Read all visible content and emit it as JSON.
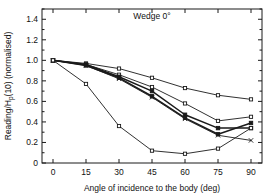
{
  "chart_data": {
    "type": "line",
    "title": "Wedge 0°",
    "xlabel": "Angle of incidence to the body (deg)",
    "ylabel": "Reading/Hₕ(10) (normalised)",
    "ylabel_parts": {
      "pre": "Reading/H",
      "sub": "p",
      "post": "(10) (normalised)"
    },
    "x": [
      0,
      15,
      30,
      45,
      60,
      75,
      90
    ],
    "xlim": [
      -5,
      95
    ],
    "ylim": [
      0,
      1.5
    ],
    "xticks": [
      0,
      15,
      30,
      45,
      60,
      75,
      90
    ],
    "xticklabels": [
      "0",
      "15",
      "30",
      "45",
      "60",
      "75",
      "90"
    ],
    "yticks": [
      0,
      0.2,
      0.4,
      0.6,
      0.8,
      1.0,
      1.2,
      1.4
    ],
    "yticklabels": [
      "0",
      "0.2",
      "0.4",
      "0.6",
      "0.8",
      "1.0",
      "1.2",
      "1.4"
    ],
    "grid": false,
    "legend": "none",
    "series": [
      {
        "name": "series-1",
        "marker": "open-square",
        "weight": "normal",
        "values": [
          1.0,
          0.97,
          0.92,
          0.83,
          0.73,
          0.66,
          0.62
        ]
      },
      {
        "name": "series-2",
        "marker": "open-square",
        "weight": "normal",
        "values": [
          1.0,
          0.96,
          0.86,
          0.74,
          0.58,
          0.41,
          0.45
        ]
      },
      {
        "name": "series-3",
        "marker": "filled-square",
        "weight": "bold",
        "values": [
          1.0,
          0.96,
          0.84,
          0.7,
          0.47,
          0.34,
          0.34
        ]
      },
      {
        "name": "series-4",
        "marker": "filled-square",
        "weight": "bold",
        "values": [
          1.0,
          0.95,
          0.83,
          0.65,
          0.44,
          0.28,
          0.39
        ]
      },
      {
        "name": "series-5",
        "marker": "cross",
        "weight": "normal",
        "values": [
          1.0,
          0.95,
          0.82,
          0.64,
          0.43,
          0.27,
          0.22
        ]
      },
      {
        "name": "series-6",
        "marker": "open-square",
        "weight": "normal",
        "values": [
          1.0,
          0.77,
          0.36,
          0.12,
          0.09,
          0.14,
          0.34
        ]
      }
    ]
  }
}
